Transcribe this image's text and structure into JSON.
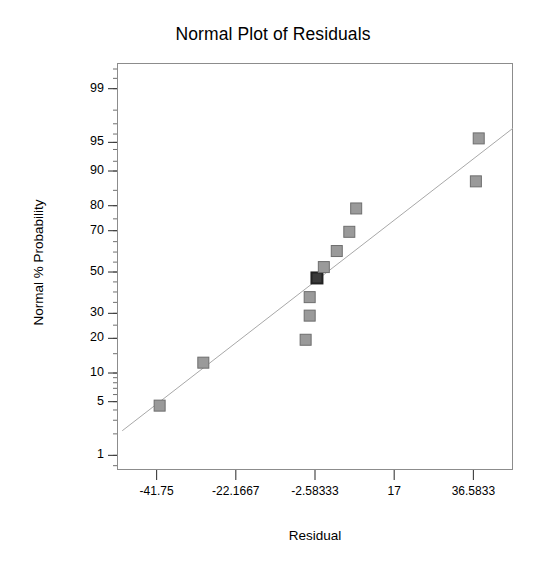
{
  "chart_data": {
    "type": "scatter",
    "title": "Normal Plot of Residuals",
    "xlabel": "Residual",
    "ylabel": "Normal % Probability",
    "grid": false,
    "legend": null,
    "x_scale": "linear",
    "y_scale": "normal-probability",
    "xlim": [
      -51.5445,
      46.3778
    ],
    "ylim": [
      0.6,
      99.6
    ],
    "x_tick_labels": [
      "-41.75",
      "-22.1667",
      "-2.58333",
      "17",
      "36.5833"
    ],
    "x_tick_values": [
      -41.75,
      -22.1667,
      -2.58333,
      17,
      36.5833
    ],
    "y_tick_labels": [
      "99",
      "95",
      "90",
      "80",
      "70",
      "50",
      "30",
      "20",
      "10",
      "5",
      "1"
    ],
    "y_tick_values": [
      99,
      95,
      90,
      80,
      70,
      50,
      30,
      20,
      10,
      5,
      1
    ],
    "points": [
      {
        "x": -41.0,
        "y": 4.5,
        "overlap": false
      },
      {
        "x": -30.2,
        "y": 12.5,
        "overlap": false
      },
      {
        "x": -4.9,
        "y": 19.5,
        "overlap": false
      },
      {
        "x": -3.9,
        "y": 29.0,
        "overlap": false
      },
      {
        "x": -3.9,
        "y": 37.5,
        "overlap": false
      },
      {
        "x": -2.1,
        "y": 47.0,
        "overlap": true
      },
      {
        "x": -0.4,
        "y": 52.5,
        "overlap": false
      },
      {
        "x": 2.8,
        "y": 60.5,
        "overlap": false
      },
      {
        "x": 5.9,
        "y": 69.5,
        "overlap": false
      },
      {
        "x": 7.6,
        "y": 79.0,
        "overlap": false
      },
      {
        "x": 37.2,
        "y": 87.5,
        "overlap": false
      },
      {
        "x": 37.9,
        "y": 95.5,
        "overlap": false
      }
    ],
    "reference_line": {
      "name": "normal-reference-line",
      "x_start": -50.25,
      "y_start": 2.2,
      "x_end": 46.3778,
      "y_end": 96.6
    },
    "marker": {
      "shape": "square",
      "size_px": 11,
      "fill_color": "#9a9a9a",
      "edge_color": "#6e6e6e",
      "overlap_fill_color": "#3a3a3a"
    },
    "colors": {
      "frame": "#8c8c8c",
      "line": "#a8a8a8",
      "text": "#000000",
      "background": "#ffffff"
    }
  },
  "figure": {
    "title": "Normal Plot of Residuals",
    "x_axis_title": "Residual",
    "y_axis_title": "Normal % Probability"
  }
}
